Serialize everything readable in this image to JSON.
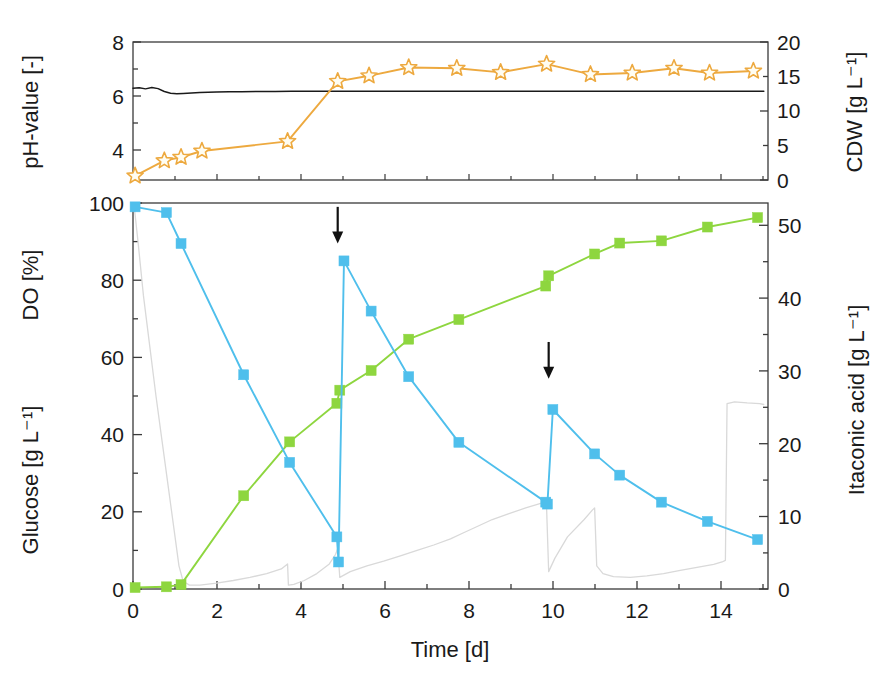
{
  "figure": {
    "caption_fragment": " "
  },
  "chart_data": [
    {
      "id": "top-panel",
      "type": "line",
      "title": "",
      "xlabel": "",
      "ylabel": "pH-value  [-]",
      "y2label": "CDW  [g L⁻¹]",
      "xlim": [
        0,
        15.2
      ],
      "ylim": [
        2.2,
        8
      ],
      "y2lim": [
        0,
        20
      ],
      "grid": false,
      "legend": "none",
      "yticks": [
        4,
        6,
        8
      ],
      "ytick_labels": [
        "4",
        "6",
        "8"
      ],
      "y2ticks": [
        0,
        5,
        10,
        15,
        20
      ],
      "y2tick_labels": [
        "0",
        "5",
        "10",
        "15",
        "20"
      ],
      "xticks": [
        0,
        2,
        4,
        6,
        8,
        10,
        12,
        14
      ],
      "series": [
        {
          "name": "pH-value",
          "axis": "left",
          "color": "#1a1a1a",
          "marker": "none",
          "style": "noisy-line",
          "x": [
            0.0,
            0.15,
            0.3,
            0.45,
            0.6,
            0.75,
            0.9,
            1.05,
            1.2,
            1.4,
            1.6,
            1.8,
            2.0,
            2.3,
            2.6,
            3.0,
            3.4,
            3.8,
            4.2,
            4.6,
            5.0,
            5.6,
            6.2,
            6.8,
            7.4,
            8.0,
            8.6,
            9.2,
            9.8,
            10.4,
            11.0,
            11.6,
            12.2,
            12.8,
            13.4,
            14.0,
            14.6,
            15.1
          ],
          "y": [
            6.06,
            6.08,
            6.03,
            6.09,
            6.04,
            5.92,
            5.85,
            5.82,
            5.84,
            5.86,
            5.88,
            5.89,
            5.9,
            5.91,
            5.91,
            5.92,
            5.92,
            5.93,
            5.93,
            5.93,
            5.93,
            5.93,
            5.93,
            5.93,
            5.93,
            5.93,
            5.93,
            5.93,
            5.93,
            5.93,
            5.93,
            5.93,
            5.93,
            5.93,
            5.93,
            5.93,
            5.93,
            5.93
          ]
        },
        {
          "name": "CDW",
          "axis": "right",
          "color": "#EDA93F",
          "marker": "star",
          "style": "line-marker",
          "x": [
            0.05,
            0.75,
            1.15,
            1.65,
            3.7,
            4.9,
            5.65,
            6.6,
            7.75,
            8.8,
            9.9,
            10.95,
            11.95,
            12.95,
            13.8,
            14.85
          ],
          "y": [
            0.6,
            2.8,
            3.3,
            4.2,
            5.6,
            14.3,
            15.1,
            16.3,
            16.2,
            15.6,
            16.8,
            15.3,
            15.5,
            16.2,
            15.5,
            15.8
          ]
        }
      ]
    },
    {
      "id": "main-panel",
      "type": "line",
      "title": "",
      "xlabel": "Time  [d]",
      "ylabel": "DO  [%]   /   Glucose  [g L⁻¹]",
      "ylabel_1": "DO  [%]",
      "ylabel_2": "Glucose  [g L⁻¹]",
      "y2label": "Itaconic acid  [g L⁻¹]",
      "xlim": [
        0,
        15.2
      ],
      "ylim": [
        0,
        100
      ],
      "y2lim": [
        0,
        53
      ],
      "grid": false,
      "legend": "none",
      "yticks": [
        0,
        20,
        40,
        60,
        80,
        100
      ],
      "ytick_labels": [
        "0",
        "20",
        "40",
        "60",
        "80",
        "100"
      ],
      "y2ticks": [
        0,
        10,
        20,
        30,
        40,
        50
      ],
      "y2tick_labels": [
        "0",
        "10",
        "20",
        "30",
        "40",
        "50"
      ],
      "xticks": [
        0,
        2,
        4,
        6,
        8,
        10,
        12,
        14
      ],
      "xtick_labels": [
        "0",
        "2",
        "4",
        "6",
        "8",
        "10",
        "12",
        "14"
      ],
      "annotations": [
        {
          "name": "feed-pulse-arrow-1",
          "type": "down-arrow",
          "x": 4.9,
          "y_top": 99.0,
          "y_tip": 90.0
        },
        {
          "name": "feed-pulse-arrow-2",
          "type": "down-arrow",
          "x": 9.95,
          "y_top": 64.0,
          "y_tip": 55.0
        }
      ],
      "series": [
        {
          "name": "Glucose",
          "axis": "left",
          "color": "#4FBFEC",
          "marker": "square",
          "style": "line-marker",
          "x": [
            0.05,
            0.8,
            1.15,
            2.65,
            3.75,
            4.88,
            4.92,
            5.05,
            5.7,
            6.6,
            7.8,
            9.88,
            9.92,
            10.05,
            11.05,
            11.65,
            12.65,
            13.75,
            14.95
          ],
          "y": [
            99.0,
            97.5,
            89.5,
            55.5,
            32.8,
            13.5,
            7.0,
            85.0,
            72.0,
            55.0,
            38.0,
            22.5,
            22.0,
            46.5,
            35.0,
            29.5,
            22.5,
            17.5,
            12.8
          ]
        },
        {
          "name": "Itaconic acid",
          "axis": "right",
          "color": "#8ED63F",
          "marker": "square",
          "style": "line-marker",
          "x": [
            0.05,
            0.8,
            1.15,
            2.65,
            3.75,
            4.88,
            4.95,
            5.7,
            6.6,
            7.8,
            9.88,
            9.95,
            11.05,
            11.65,
            12.65,
            13.75,
            14.95
          ],
          "y": [
            0.2,
            0.3,
            0.6,
            12.8,
            20.2,
            25.5,
            27.3,
            30.0,
            34.3,
            37.0,
            41.6,
            43.0,
            46.0,
            47.5,
            47.8,
            49.7,
            51.0
          ]
        },
        {
          "name": "DO",
          "axis": "left",
          "color": "#D9D9D9",
          "marker": "none",
          "style": "noisy-line",
          "x": [
            0.03,
            0.12,
            0.25,
            0.4,
            0.55,
            0.7,
            0.85,
            1.0,
            1.1,
            1.2,
            1.35,
            1.6,
            2.0,
            2.4,
            2.8,
            3.2,
            3.55,
            3.7,
            3.72,
            3.85,
            4.1,
            4.4,
            4.7,
            4.85,
            4.9,
            4.95,
            5.2,
            5.6,
            6.0,
            6.4,
            6.8,
            7.2,
            7.6,
            7.9,
            8.2,
            8.6,
            9.0,
            9.4,
            9.7,
            9.85,
            9.9,
            9.95,
            10.1,
            10.4,
            10.8,
            11.0,
            11.05,
            11.1,
            11.25,
            11.5,
            11.9,
            12.3,
            12.7,
            13.1,
            13.5,
            13.9,
            14.1,
            14.18,
            14.22,
            14.4,
            14.7,
            15.0,
            15.1
          ],
          "y": [
            99.0,
            90.0,
            76.0,
            63.0,
            50.0,
            38.0,
            26.0,
            14.0,
            6.0,
            2.0,
            1.0,
            1.0,
            1.5,
            2.2,
            3.0,
            4.0,
            5.2,
            6.5,
            1.0,
            1.2,
            2.2,
            4.0,
            6.5,
            9.0,
            10.5,
            3.0,
            4.5,
            6.0,
            7.2,
            8.6,
            10.0,
            11.4,
            13.0,
            14.5,
            16.0,
            18.0,
            19.5,
            21.0,
            22.0,
            22.5,
            21.0,
            4.5,
            8.0,
            13.5,
            18.0,
            20.5,
            21.0,
            6.0,
            4.0,
            3.2,
            3.0,
            3.4,
            4.0,
            4.8,
            5.6,
            6.4,
            7.0,
            7.4,
            48.0,
            48.5,
            48.2,
            48.0,
            47.8
          ]
        }
      ]
    }
  ]
}
